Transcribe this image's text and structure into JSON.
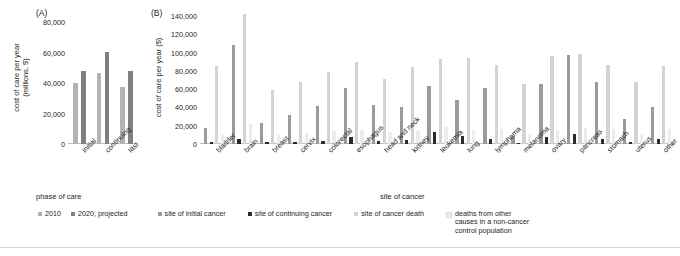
{
  "panelA": {
    "letter": "(A)",
    "ylabel": "cost of care per year\n(millions, $)",
    "xlabel": "phase of care",
    "chart_data": {
      "type": "bar",
      "title": "(A) Cost of care per year by phase of care",
      "xlabel": "phase of care",
      "ylabel": "cost of care per year (millions, $)",
      "categories": [
        "initial",
        "continuing",
        "last"
      ],
      "series": [
        {
          "name": "2010",
          "color": "#b3b3b3",
          "values": [
            40000,
            46500,
            37500
          ]
        },
        {
          "name": "2020, projected",
          "color": "#808080",
          "values": [
            48000,
            60500,
            48000
          ]
        }
      ],
      "ylim": [
        0,
        80000
      ],
      "yticks": [
        0,
        20000,
        40000,
        60000,
        80000
      ],
      "ytick_labels": [
        "0",
        "20,000",
        "40,000",
        "60,000",
        "80,000"
      ],
      "grid": false,
      "legend_position": "bottom"
    }
  },
  "panelB": {
    "letter": "(B)",
    "ylabel": "cost of care per year ($)",
    "xlabel": "site of cancer",
    "chart_data": {
      "type": "bar",
      "title": "(B) Cost of care per year by site of cancer",
      "xlabel": "site of cancer",
      "ylabel": "cost of care per year ($)",
      "categories": [
        "bladder",
        "brain",
        "breast",
        "cervix",
        "colorectal",
        "esophagus",
        "head and neck",
        "kidney",
        "leukemia",
        "lung",
        "lymphoma",
        "melanoma",
        "ovary",
        "pancreas",
        "stomach",
        "uterus",
        "other"
      ],
      "series": [
        {
          "name": "site of initial cancer",
          "color": "#9a9a9a",
          "values": [
            18000,
            108000,
            23000,
            32000,
            42000,
            61000,
            43000,
            40000,
            64000,
            48000,
            61000,
            9000,
            66000,
            97000,
            68000,
            27000,
            40000
          ]
        },
        {
          "name": "site of continuing cancer",
          "color": "#2b2b2b",
          "values": [
            2500,
            5000,
            2000,
            2500,
            3000,
            7500,
            3500,
            4000,
            13000,
            9000,
            5000,
            1500,
            8000,
            11000,
            6000,
            2000,
            5000
          ]
        },
        {
          "name": "site of cancer death",
          "color": "#d3d3d3",
          "values": [
            85000,
            142000,
            59000,
            68000,
            79000,
            90000,
            71000,
            84000,
            93000,
            94000,
            86000,
            66000,
            96000,
            98000,
            86000,
            68000,
            85000
          ]
        },
        {
          "name": "deaths from other causes in a non-cancer control population",
          "color": "#ececec",
          "values": [
            10000,
            22000,
            10000,
            12000,
            14000,
            15000,
            13000,
            14000,
            19000,
            15000,
            16000,
            10000,
            15000,
            18000,
            16000,
            11000,
            16000
          ]
        }
      ],
      "ylim": [
        0,
        140000
      ],
      "yticks": [
        0,
        20000,
        40000,
        60000,
        80000,
        100000,
        120000,
        140000
      ],
      "ytick_labels": [
        "0",
        "20,000",
        "40,000",
        "60,000",
        "80,000",
        "100,000",
        "120,000",
        "140,000"
      ],
      "grid": false,
      "legend_position": "bottom"
    }
  },
  "legend": [
    {
      "label": "2010",
      "color": "#b3b3b3"
    },
    {
      "label": "2020, projected",
      "color": "#808080"
    },
    {
      "label": "site of initial cancer",
      "color": "#9a9a9a"
    },
    {
      "label": "site of continuing cancer",
      "color": "#2b2b2b"
    },
    {
      "label": "site of cancer death",
      "color": "#d3d3d3"
    },
    {
      "label": "deaths from other\ncauses in a non-cancer\ncontrol population",
      "color": "#ececec"
    }
  ]
}
